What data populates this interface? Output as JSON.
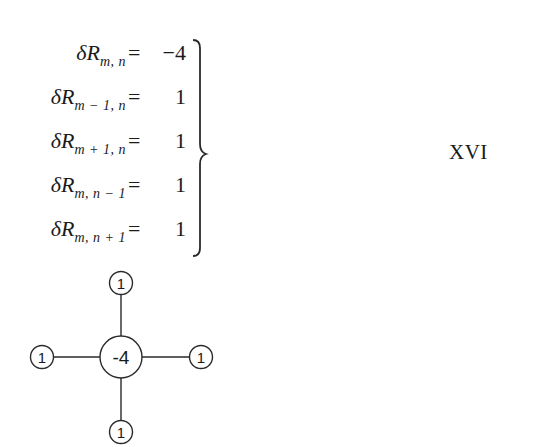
{
  "equations": [
    {
      "lhs_symbol": "δR",
      "subscript": "m, n",
      "equals": "=",
      "rhs": "−4"
    },
    {
      "lhs_symbol": "δR",
      "subscript": "m − 1, n",
      "equals": "=",
      "rhs": "1"
    },
    {
      "lhs_symbol": "δR",
      "subscript": "m + 1, n",
      "equals": "=",
      "rhs": "1"
    },
    {
      "lhs_symbol": "δR",
      "subscript": "m, n − 1",
      "equals": "=",
      "rhs": "1"
    },
    {
      "lhs_symbol": "δR",
      "subscript": "m, n + 1",
      "equals": "=",
      "rhs": "1"
    }
  ],
  "equation_label": "XVI",
  "stencil": {
    "center": {
      "value": "-4"
    },
    "top": {
      "value": "1"
    },
    "bottom": {
      "value": "1"
    },
    "left": {
      "value": "1"
    },
    "right": {
      "value": "1"
    }
  }
}
